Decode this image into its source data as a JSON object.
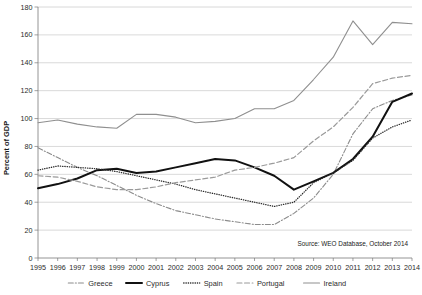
{
  "chart_data": {
    "type": "line",
    "title": "",
    "xlabel": "",
    "ylabel": "Percent of GDP",
    "ylim": [
      0,
      180
    ],
    "ytick_step": 20,
    "yticks": [
      "0",
      "20",
      "40",
      "60",
      "80",
      "100",
      "120",
      "140",
      "160",
      "180"
    ],
    "grid": true,
    "legend_position": "bottom",
    "x": [
      "1995",
      "1996",
      "1997",
      "1998",
      "1999",
      "2000",
      "2001",
      "2002",
      "2003",
      "2004",
      "2005",
      "2006",
      "2007",
      "2008",
      "2009",
      "2010",
      "2011",
      "2012",
      "2013",
      "2014"
    ],
    "categories": [
      "1995",
      "1996",
      "1997",
      "1998",
      "1999",
      "2000",
      "2001",
      "2002",
      "2003",
      "2004",
      "2005",
      "2006",
      "2007",
      "2008",
      "2009",
      "2010",
      "2011",
      "2012",
      "2013",
      "2014"
    ],
    "series": [
      {
        "name": "Greece",
        "style": "dash-dot",
        "color": "#8c8c8c",
        "width": 1.1,
        "values": [
          79,
          72,
          65,
          59,
          52,
          45,
          39,
          34,
          31,
          28,
          26,
          24,
          24,
          32,
          43,
          60,
          89,
          107,
          113,
          117
        ]
      },
      {
        "name": "Cyprus",
        "style": "solid",
        "color": "#111111",
        "width": 2.0,
        "values": [
          50,
          53,
          57,
          63,
          64,
          61,
          62,
          65,
          68,
          71,
          70,
          65,
          59,
          49,
          55,
          61,
          71,
          87,
          112,
          118
        ]
      },
      {
        "name": "Spain",
        "style": "dotted",
        "color": "#2b2b2b",
        "width": 1.3,
        "values": [
          63,
          66,
          65,
          64,
          62,
          59,
          56,
          53,
          49,
          46,
          43,
          40,
          37,
          40,
          54,
          61,
          70,
          86,
          94,
          99
        ]
      },
      {
        "name": "Portugal",
        "style": "dashed",
        "color": "#9a9a9a",
        "width": 1.2,
        "values": [
          59,
          58,
          55,
          51,
          49,
          49,
          51,
          54,
          56,
          58,
          63,
          65,
          68,
          72,
          84,
          94,
          108,
          125,
          129,
          131
        ]
      },
      {
        "name": "Ireland",
        "style": "solid",
        "color": "#8f8f8f",
        "width": 1.1,
        "values": [
          97,
          99,
          96,
          94,
          93,
          103,
          103,
          101,
          97,
          98,
          100,
          107,
          107,
          113,
          128,
          144,
          170,
          153,
          169,
          168
        ]
      }
    ],
    "annotation": "Source: WEO Database, October 2014"
  },
  "legend": {
    "items": [
      {
        "label": "Greece"
      },
      {
        "label": "Cyprus"
      },
      {
        "label": "Spain"
      },
      {
        "label": "Portugal"
      },
      {
        "label": "Ireland"
      }
    ]
  }
}
